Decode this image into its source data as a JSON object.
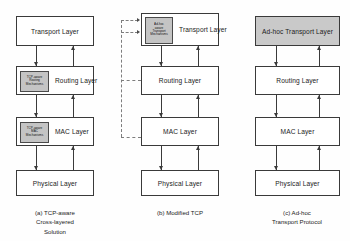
{
  "figure": {
    "colors": {
      "box_border": "#3a3a3a",
      "box_fill": "#ffffff",
      "shaded_fill": "#c9c9c9",
      "mechanism_fill": "#c4c4c4",
      "arrow": "#3a3a3a",
      "dashed_line": "#7d7d7d",
      "background": "#fefefe"
    }
  },
  "panels": [
    {
      "id": "a",
      "caption_lines": [
        "(a) TCP-aware",
        "Cross-layered",
        "Solution"
      ],
      "layers": [
        {
          "name": "transport",
          "label": "Transport Layer",
          "shaded": false,
          "mechanism": null
        },
        {
          "name": "routing",
          "label": "Routing Layer",
          "shaded": false,
          "mechanism": {
            "lines": [
              "TCP-aware",
              "Routing",
              "Mechanisms"
            ]
          }
        },
        {
          "name": "mac",
          "label": "MAC Layer",
          "shaded": false,
          "mechanism": {
            "lines": [
              "TCP-aware",
              "MAC",
              "Mechanisms"
            ]
          }
        },
        {
          "name": "physical",
          "label": "Physical Layer",
          "shaded": false,
          "mechanism": null
        }
      ]
    },
    {
      "id": "b",
      "caption_lines": [
        "(b) Modified TCP"
      ],
      "layers": [
        {
          "name": "transport",
          "label": "Transport Layer",
          "shaded": false,
          "mechanism": {
            "lines": [
              "Ad-hoc",
              "aware",
              "Transport",
              "Mechanisms"
            ]
          }
        },
        {
          "name": "routing",
          "label": "Routing Layer",
          "shaded": false,
          "mechanism": null
        },
        {
          "name": "mac",
          "label": "MAC Layer",
          "shaded": false,
          "mechanism": null
        },
        {
          "name": "physical",
          "label": "Physical Layer",
          "shaded": false,
          "mechanism": null
        }
      ]
    },
    {
      "id": "c",
      "caption_lines": [
        "(c) Ad-hoc",
        "Transport Protocol"
      ],
      "layers": [
        {
          "name": "transport",
          "label": "Ad-hoc Transport Layer",
          "shaded": true,
          "mechanism": null
        },
        {
          "name": "routing",
          "label": "Routing Layer",
          "shaded": false,
          "mechanism": null
        },
        {
          "name": "mac",
          "label": "MAC Layer",
          "shaded": false,
          "mechanism": null
        },
        {
          "name": "physical",
          "label": "Physical Layer",
          "shaded": false,
          "mechanism": null
        }
      ]
    }
  ]
}
